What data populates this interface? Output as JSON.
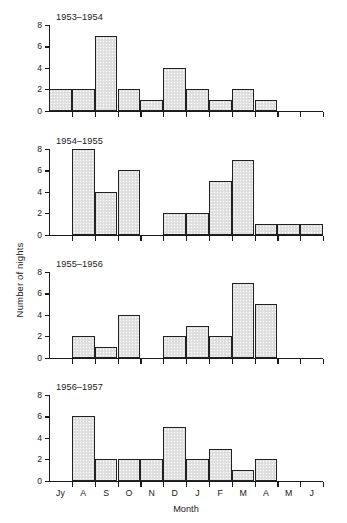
{
  "chart_data": {
    "type": "bar",
    "title": "",
    "xlabel": "Month",
    "ylabel": "Number of nights",
    "categories": [
      "Jy",
      "A",
      "S",
      "O",
      "N",
      "D",
      "J",
      "F",
      "M",
      "A",
      "M",
      "J"
    ],
    "ylim": [
      0,
      8
    ],
    "yticks": [
      0,
      2,
      4,
      6,
      8
    ],
    "grid": false,
    "legend_position": "none",
    "panel_layout": "4 stacked panels sharing x-axis",
    "panels": [
      {
        "label": "1953–1954",
        "values": [
          2,
          2,
          7,
          2,
          1,
          4,
          2,
          1,
          2,
          1,
          0,
          0
        ]
      },
      {
        "label": "1954–1955",
        "values": [
          0,
          8,
          4,
          6,
          0,
          2,
          2,
          5,
          7,
          1,
          1,
          1
        ]
      },
      {
        "label": "1955–1956",
        "values": [
          0,
          2,
          1,
          4,
          0,
          2,
          3,
          2,
          7,
          5,
          0,
          0
        ]
      },
      {
        "label": "1956–1957",
        "values": [
          0,
          6,
          2,
          2,
          2,
          5,
          2,
          3,
          1,
          2,
          0,
          0
        ]
      }
    ],
    "colors": {
      "bar_fill": "#e3e3e3",
      "bar_edge": "#222222",
      "axis": "#1a1a1a",
      "text": "#1a1a1a",
      "background": "#ffffff"
    }
  },
  "axis": {
    "ylabel": "Number of nights",
    "xlabel": "Month",
    "ytick_labels": [
      "0",
      "2",
      "4",
      "6",
      "8"
    ],
    "xtick_labels": [
      "Jy",
      "A",
      "S",
      "O",
      "N",
      "D",
      "J",
      "F",
      "M",
      "A",
      "M",
      "J"
    ]
  },
  "panel_titles": {
    "p0": "1953–1954",
    "p1": "1954–1955",
    "p2": "1955–1956",
    "p3": "1956–1957"
  }
}
